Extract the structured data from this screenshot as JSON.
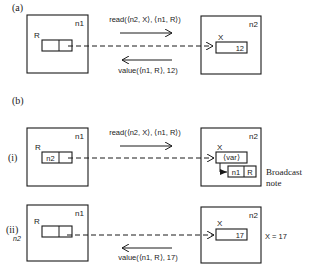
{
  "figure": {
    "part_a": {
      "label": "(a)",
      "node_left": {
        "name": "n1",
        "cell_label": "R",
        "cell_left_value": "",
        "cell_right_value": ""
      },
      "node_right": {
        "name": "n2",
        "cell_label": "X",
        "cell_value": "12"
      },
      "message_forward": "read(⟨n2, X⟩, ⟨n1, R⟩)",
      "message_back": "value(⟨n1, R⟩, 12)"
    },
    "part_b": {
      "label": "(b)",
      "step_i": {
        "label": "(i)",
        "node_left": {
          "name": "n1",
          "cell_label": "R",
          "cell_left_value": "n2",
          "cell_right_value": ""
        },
        "node_right": {
          "name": "n2",
          "cell_label": "X",
          "cell_value": "⟨var⟩",
          "note_cell_left": "n1",
          "note_cell_right": "R"
        },
        "message_forward": "read(⟨n2, X⟩, ⟨n1, R⟩)",
        "annotation_line1": "Broadcast",
        "annotation_line2": "note"
      },
      "step_ii": {
        "label": "(ii)",
        "side_label": "n2",
        "node_left": {
          "name": "n1",
          "cell_label": "R",
          "cell_left_value": "",
          "cell_right_value": ""
        },
        "node_right": {
          "name": "n2",
          "cell_label": "X",
          "cell_value": "17"
        },
        "message_back": "value(⟨n1, R⟩, 17)",
        "annotation": "X = 17"
      }
    }
  }
}
